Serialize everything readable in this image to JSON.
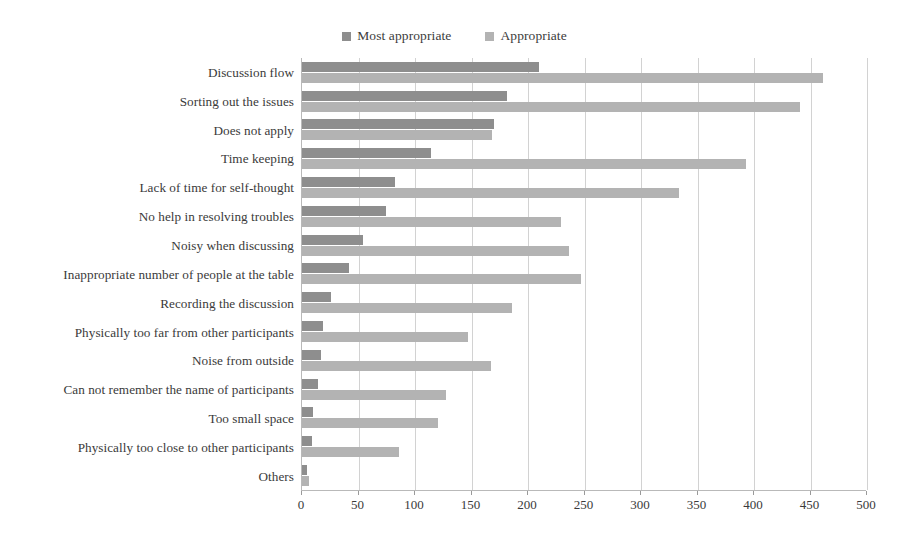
{
  "chart_data": {
    "type": "bar",
    "orientation": "horizontal",
    "title": "",
    "subtitle": "",
    "xlabel": "",
    "ylabel": "",
    "xlim": [
      0,
      500
    ],
    "xticks": [
      0,
      50,
      100,
      150,
      200,
      250,
      300,
      350,
      400,
      450,
      500
    ],
    "xtick_labels": [
      "0",
      "50",
      "100",
      "150",
      "200",
      "250",
      "300",
      "350",
      "400",
      "450",
      "500"
    ],
    "grid": "vertical",
    "legend_position": "top-center",
    "categories": [
      "Discussion flow",
      "Sorting out the issues",
      "Does not apply",
      "Time keeping",
      "Lack of time for self-thought",
      "No help in resolving troubles",
      "Noisy when discussing",
      "Inappropriate number of  people at the table",
      "Recording the discussion",
      "Physically too far from other participants",
      "Noise from outside",
      "Can not remember the name of participants",
      "Too small space",
      "Physically too close to other participants",
      "Others"
    ],
    "series": [
      {
        "name": "Most appropriate",
        "color": "#8e8e8e",
        "values": [
          210,
          181,
          170,
          114,
          82,
          74,
          54,
          42,
          26,
          19,
          17,
          14,
          10,
          9,
          4
        ]
      },
      {
        "name": "Appropriate",
        "color": "#b3b3b3",
        "values": [
          461,
          441,
          168,
          393,
          334,
          229,
          236,
          247,
          186,
          147,
          167,
          127,
          120,
          86,
          6
        ]
      }
    ]
  },
  "legend": {
    "entries": [
      {
        "label": "Most appropriate",
        "color": "#8e8e8e"
      },
      {
        "label": "Appropriate",
        "color": "#b3b3b3"
      }
    ]
  },
  "colors": {
    "most_appropriate": "#8e8e8e",
    "appropriate": "#b3b3b3",
    "gridline": "#d2d2d2",
    "axis": "#b9b9b9",
    "text": "#3a3a3a",
    "background": "#ffffff"
  }
}
